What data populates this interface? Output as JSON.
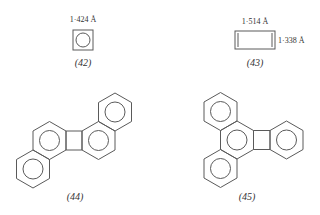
{
  "figure": {
    "structures": [
      {
        "id": "42",
        "caption": "(42)",
        "bond_label": "1·424 Å"
      },
      {
        "id": "43",
        "caption": "(43)",
        "bond_label_top": "1·514 Å",
        "bond_label_side": "1·338 Å"
      },
      {
        "id": "44",
        "caption": "(44)"
      },
      {
        "id": "45",
        "caption": "(45)"
      }
    ],
    "colors": {
      "line": "#5a5a5a",
      "text": "#333333",
      "background": "#ffffff"
    }
  }
}
